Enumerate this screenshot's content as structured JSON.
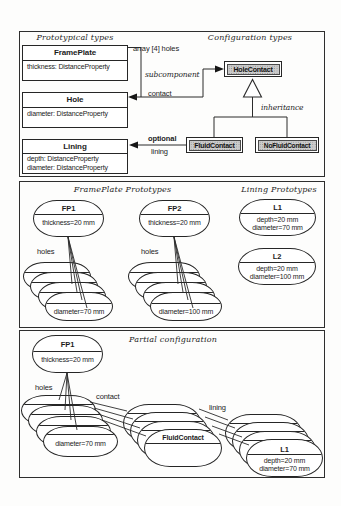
{
  "figure": {
    "panel1": {
      "header_left": "Prototypical types",
      "header_right": "Configuration types",
      "frameplate": {
        "title": "FramePlate",
        "attr1": "thickness: DistanceProperty"
      },
      "hole": {
        "title": "Hole",
        "attr1": "diameter: DistanceProperty"
      },
      "lining_class": {
        "title": "Lining",
        "attr1": "depth: DistanceProperty",
        "attr2": "diameter: DistanceProperty"
      },
      "holecontact": "HoleContact",
      "fluidcontact": "FluidContact",
      "nofluidcontact": "NoFluidContact",
      "label_array_bold": "array",
      "label_array_rest": "[4] holes",
      "label_subcomponent": "subcomponent",
      "label_contact": "contact",
      "label_optional": "optional",
      "label_lining": "lining",
      "label_inheritance": "inheritance"
    },
    "panel2": {
      "header_left": "FramePlate Prototypes",
      "header_right": "Lining Prototypes",
      "fp1": {
        "title": "FP1",
        "attr": "thickness=20 mm"
      },
      "fp2": {
        "title": "FP2",
        "attr": "thickness=20 mm"
      },
      "l1": {
        "title": "L1",
        "attr1": "depth=20 mm",
        "attr2": "diameter=70 mm"
      },
      "l2": {
        "title": "L2",
        "attr1": "depth=20 mm",
        "attr2": "diameter=100 mm"
      },
      "holes1": "holes",
      "holes2": "holes",
      "stack1_attr": "diameter=70 mm",
      "stack2_attr": "diameter=100 mm"
    },
    "panel3": {
      "header": "Partial configuration",
      "fp1": {
        "title": "FP1",
        "attr": "thickness=20 mm"
      },
      "label_holes": "holes",
      "label_contact": "contact",
      "label_lining": "lining",
      "stack_left_attr": "diameter=70 mm",
      "stack_mid_title": "FluidContact",
      "stack_right": {
        "title": "L1",
        "attr1": "depth=20 mm",
        "attr2": "diameter=70 mm"
      }
    }
  },
  "colors": {
    "shaded_box_fill": "#cbcbcb",
    "line": "#2b2b2b",
    "background": "#fdfdfc"
  }
}
